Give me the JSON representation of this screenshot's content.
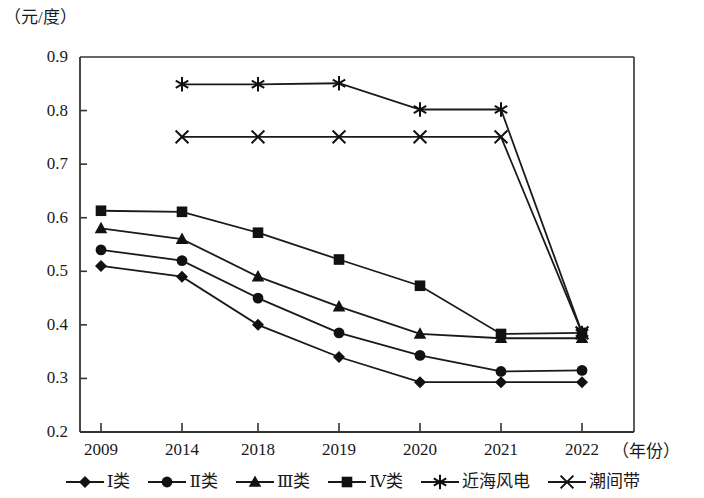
{
  "axis": {
    "unit_label": "（元/度）",
    "x_axis_title": "（年份）",
    "y_ticks": [
      "0.9",
      "0.8",
      "0.7",
      "0.6",
      "0.5",
      "0.4",
      "0.3",
      "0.2"
    ],
    "x_ticks": [
      "2009",
      "2014",
      "2018",
      "2019",
      "2020",
      "2021",
      "2022"
    ]
  },
  "legend": {
    "items": [
      {
        "label": "Ⅰ类",
        "marker": "diamond-marker"
      },
      {
        "label": "Ⅱ类",
        "marker": "circle-marker"
      },
      {
        "label": "Ⅲ类",
        "marker": "triangle-marker"
      },
      {
        "label": "Ⅳ类",
        "marker": "square-marker"
      },
      {
        "label": "近海风电",
        "marker": "asterisk-marker"
      },
      {
        "label": "潮间带",
        "marker": "cross-marker"
      }
    ]
  },
  "colors": {
    "line": "#1a1a1a",
    "marker": "#111111",
    "axis": "#333333",
    "background": "#ffffff"
  },
  "chart_data": {
    "type": "line",
    "title": "",
    "xlabel": "（年份）",
    "ylabel": "（元/度）",
    "categories": [
      "2009",
      "2014",
      "2018",
      "2019",
      "2020",
      "2021",
      "2022"
    ],
    "ylim": [
      0.2,
      0.9
    ],
    "ytick_step": 0.1,
    "grid": false,
    "legend_position": "bottom",
    "series": [
      {
        "name": "Ⅰ类",
        "marker": "diamond",
        "values": [
          0.51,
          0.49,
          0.4,
          0.34,
          0.293,
          0.293,
          0.293
        ]
      },
      {
        "name": "Ⅱ类",
        "marker": "circle",
        "values": [
          0.54,
          0.52,
          0.45,
          0.385,
          0.343,
          0.313,
          0.315
        ]
      },
      {
        "name": "Ⅲ类",
        "marker": "triangle",
        "values": [
          0.58,
          0.56,
          0.49,
          0.434,
          0.383,
          0.375,
          0.375
        ]
      },
      {
        "name": "Ⅳ类",
        "marker": "square",
        "values": [
          0.613,
          0.611,
          0.572,
          0.522,
          0.473,
          0.383,
          0.385
        ]
      },
      {
        "name": "近海风电",
        "marker": "asterisk",
        "values": [
          null,
          0.849,
          0.849,
          0.851,
          0.802,
          0.802,
          0.385
        ]
      },
      {
        "name": "潮间带",
        "marker": "cross",
        "values": [
          null,
          0.751,
          0.751,
          0.751,
          0.751,
          0.751,
          0.385
        ]
      }
    ]
  }
}
